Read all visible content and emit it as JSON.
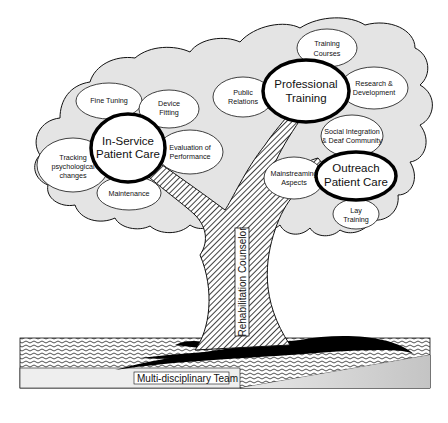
{
  "diagram": {
    "type": "tree-metaphor",
    "colors": {
      "canopy_fill": "#e4e4e4",
      "outline": "#111111",
      "bubble_fill": "#ffffff",
      "ground_fill": "#d0d0d0",
      "shadow": "#000000"
    },
    "trunk": {
      "label": "Rehabilitation Counselor"
    },
    "roots": {
      "label": "Multi-disciplinary Team"
    },
    "hubs": [
      {
        "id": "in-service",
        "line1": "In-Service",
        "line2": "Patient Care"
      },
      {
        "id": "professional",
        "line1": "Professional",
        "line2": "Training"
      },
      {
        "id": "outreach",
        "line1": "Outreach",
        "line2": "Patient Care"
      }
    ],
    "leaves": {
      "fine_tuning": {
        "line1": "Fine Tuning",
        "line2": ""
      },
      "device_fitting": {
        "line1": "Device",
        "line2": "Fitting"
      },
      "evaluation": {
        "line1": "Evaluation of",
        "line2": "Performance"
      },
      "tracking": {
        "line1": "Tracking",
        "line2": "psychological",
        "line3": "changes"
      },
      "maintenance": {
        "line1": "Maintenance",
        "line2": ""
      },
      "public_relations": {
        "line1": "Public",
        "line2": "Relations"
      },
      "training_courses": {
        "line1": "Training",
        "line2": "Courses"
      },
      "research": {
        "line1": "Research &",
        "line2": "Development"
      },
      "social_integration": {
        "line1": "Social Integration",
        "line2": "& Deaf Community"
      },
      "mainstreaming": {
        "line1": "Mainstreaming",
        "line2": "Aspects"
      },
      "lay_training": {
        "line1": "Lay",
        "line2": "Training"
      }
    }
  }
}
